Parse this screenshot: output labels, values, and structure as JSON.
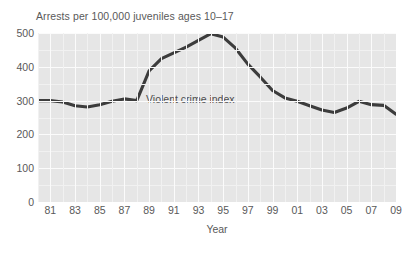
{
  "chart_data": {
    "type": "line",
    "title": "Arrests per 100,000 juveniles ages 10–17",
    "xlabel": "Year",
    "ylabel": "",
    "annotation": "Violent crime index",
    "grid": true,
    "legend_position": "none",
    "xlim": [
      1980,
      2009
    ],
    "ylim": [
      0,
      500
    ],
    "yticks": [
      500,
      400,
      300,
      200,
      100,
      0
    ],
    "ytick_labels": [
      "500",
      "400",
      "300",
      "200",
      "100",
      "0"
    ],
    "xticks": [
      1981,
      1983,
      1985,
      1987,
      1989,
      1991,
      1993,
      1995,
      1997,
      1999,
      2001,
      2003,
      2005,
      2007,
      2009
    ],
    "xtick_labels": [
      "81",
      "83",
      "85",
      "87",
      "89",
      "91",
      "93",
      "95",
      "97",
      "99",
      "01",
      "03",
      "05",
      "07",
      "09"
    ],
    "x": [
      1980,
      1981,
      1982,
      1983,
      1984,
      1985,
      1986,
      1987,
      1988,
      1989,
      1990,
      1991,
      1992,
      1993,
      1994,
      1995,
      1996,
      1997,
      1998,
      1999,
      2000,
      2001,
      2002,
      2003,
      2004,
      2005,
      2006,
      2007,
      2008,
      2009
    ],
    "series": [
      {
        "name": "Violent crime index",
        "color": "#3c3c3c",
        "values": [
          300,
          300,
          296,
          285,
          281,
          288,
          298,
          305,
          300,
          388,
          424,
          441,
          458,
          478,
          498,
          488,
          455,
          408,
          370,
          330,
          308,
          298,
          285,
          272,
          265,
          278,
          298,
          288,
          286,
          260
        ]
      }
    ],
    "colors": {
      "plot_background": "#e6e6e6",
      "gridline": "#fbfbfb",
      "series_line": "#3c3c3c",
      "text": "#595959",
      "page_background": "#ffffff"
    }
  }
}
